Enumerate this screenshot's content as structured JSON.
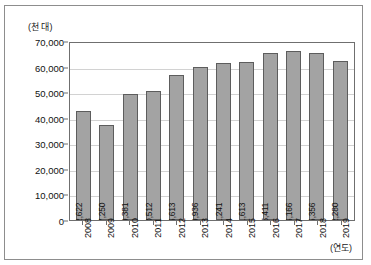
{
  "chart_data": {
    "type": "bar",
    "title": "",
    "xlabel": "(연도)",
    "ylabel": "(천 대)",
    "categories": [
      "2008",
      "2009",
      "2010",
      "2011",
      "2012",
      "2013",
      "2014",
      "2015",
      "2016",
      "2017",
      "2018",
      "2019"
    ],
    "values": [
      42622,
      37250,
      49381,
      50512,
      56613,
      59936,
      61241,
      61613,
      65411,
      66166,
      65356,
      62280
    ],
    "value_labels": [
      "42,622",
      "37,250",
      "49,381",
      "50,512",
      "56,613",
      "59,936",
      "61,241",
      "61,613",
      "65,411",
      "66,166",
      "65,356",
      "62,280"
    ],
    "ylim": [
      0,
      70000
    ],
    "ytick_labels": [
      "70,000",
      "60,000",
      "50,000",
      "40,000",
      "30,000",
      "20,000",
      "10,000",
      "0"
    ],
    "ytick_values": [
      70000,
      60000,
      50000,
      40000,
      30000,
      20000,
      10000,
      0
    ],
    "grid": true,
    "legend": "none",
    "bar_color": "#a3a3a3",
    "bar_border_color": "#5d5d5d",
    "gridline_color": "#d2d2d2",
    "axis_color": "#6f6f6f"
  }
}
